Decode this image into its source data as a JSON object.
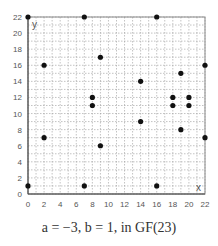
{
  "chart_data": {
    "type": "scatter",
    "title": "",
    "caption": "a = −3, b = 1, in GF(23)",
    "xlabel": "x",
    "ylabel": "y",
    "xlim": [
      0,
      22
    ],
    "ylim": [
      0,
      22
    ],
    "x_ticks": [
      0,
      2,
      4,
      6,
      8,
      10,
      12,
      14,
      16,
      18,
      20,
      22
    ],
    "y_ticks": [
      0,
      2,
      4,
      6,
      8,
      10,
      12,
      14,
      16,
      18,
      20,
      22
    ],
    "grid": true,
    "legend": null,
    "points": [
      [
        0,
        1
      ],
      [
        0,
        22
      ],
      [
        2,
        7
      ],
      [
        2,
        16
      ],
      [
        7,
        1
      ],
      [
        7,
        22
      ],
      [
        8,
        11
      ],
      [
        8,
        12
      ],
      [
        9,
        6
      ],
      [
        9,
        17
      ],
      [
        14,
        9
      ],
      [
        14,
        14
      ],
      [
        16,
        1
      ],
      [
        16,
        22
      ],
      [
        18,
        11
      ],
      [
        18,
        12
      ],
      [
        19,
        8
      ],
      [
        19,
        15
      ],
      [
        20,
        11
      ],
      [
        20,
        12
      ],
      [
        22,
        7
      ],
      [
        22,
        16
      ]
    ],
    "colors": {
      "point": "#111111",
      "axis": "#888888",
      "grid": "#9a9a9a",
      "text": "#555555"
    }
  }
}
